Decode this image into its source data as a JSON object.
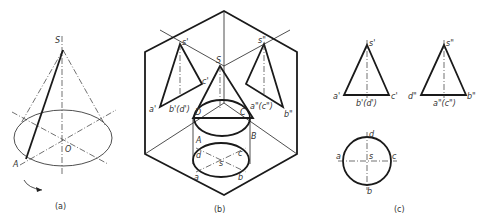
{
  "figure": {
    "panels": [
      {
        "id": "a",
        "caption": "(a)",
        "labels": {
          "apex": "S",
          "center": "O",
          "point": "A"
        }
      },
      {
        "id": "b",
        "caption": "(b)",
        "labels": {
          "s_prime": "s'",
          "s_dprime": "s\"",
          "apex": "S",
          "c_prime": "c'",
          "a_prime": "a'",
          "bd_prime": "b'(d')",
          "D": "D",
          "C": "C",
          "ac_dprime": "a\"(c\")",
          "b_dprime": "b\"",
          "A": "A",
          "B": "B",
          "d": "d",
          "c": "c",
          "s": "s",
          "a": "a",
          "b": "b"
        }
      },
      {
        "id": "c",
        "caption": "(c)",
        "labels": {
          "s_prime": "s'",
          "a_prime": "a'",
          "bd_prime": "b'(d')",
          "c_prime": "c'",
          "s_dprime": "s\"",
          "d_dprime": "d\"",
          "ac_dprime": "a\"(c\")",
          "b_dprime": "b\"",
          "d": "d",
          "a": "a",
          "s": "s",
          "c": "c",
          "b": "b"
        }
      }
    ]
  }
}
